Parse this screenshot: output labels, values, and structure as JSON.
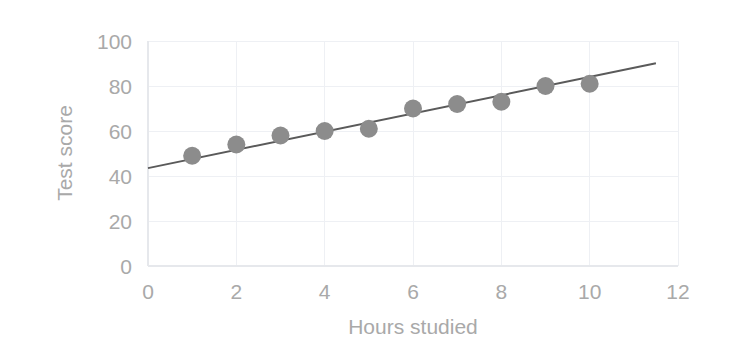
{
  "chart_data": {
    "type": "scatter",
    "title": "",
    "xlabel": "Hours studied",
    "ylabel": "Test score",
    "xlim": [
      0,
      12
    ],
    "ylim": [
      0,
      100
    ],
    "x_ticks": [
      "0",
      "2",
      "4",
      "6",
      "8",
      "10",
      "12"
    ],
    "y_ticks": [
      "0",
      "20",
      "40",
      "60",
      "80",
      "100"
    ],
    "x_tick_values": [
      0,
      2,
      4,
      6,
      8,
      10,
      12
    ],
    "y_tick_values": [
      0,
      20,
      40,
      60,
      80,
      100
    ],
    "grid": true,
    "legend": "none",
    "x": [
      1,
      2,
      3,
      4,
      5,
      6,
      7,
      8,
      9,
      10
    ],
    "values": [
      49,
      54,
      58,
      60,
      61,
      70,
      72,
      73,
      80,
      81
    ],
    "points": [
      {
        "x": 1,
        "y": 49
      },
      {
        "x": 2,
        "y": 54
      },
      {
        "x": 3,
        "y": 58
      },
      {
        "x": 4,
        "y": 60
      },
      {
        "x": 5,
        "y": 61
      },
      {
        "x": 6,
        "y": 70
      },
      {
        "x": 7,
        "y": 72
      },
      {
        "x": 8,
        "y": 73
      },
      {
        "x": 9,
        "y": 80
      },
      {
        "x": 10,
        "y": 81
      }
    ],
    "trendline": {
      "type": "linear",
      "slope": 4.05,
      "intercept": 43.5,
      "x_start": 0,
      "x_end": 11.5,
      "y_start": 43.5,
      "y_end": 90.1
    },
    "colors": {
      "marker": "#8c8c8c",
      "trendline": "#5a5a5a",
      "grid": "#eef0f4",
      "axis": "#e6e8ec",
      "text": "#a9a9a9",
      "background": "#ffffff"
    },
    "marker_radius": 9
  }
}
